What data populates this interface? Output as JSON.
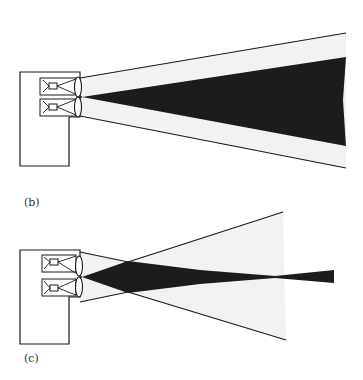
{
  "figure": {
    "panels": [
      {
        "id": "b",
        "label": "(b)",
        "description": "Two-lens projector with wide outer beam cone and dark diverging inner beam"
      },
      {
        "id": "c",
        "label": "(c)",
        "description": "Two-lens projector with crossing outer rays and dark beam converging to a waist then re-expanding"
      }
    ]
  },
  "colors": {
    "line": "#1a1a1a",
    "beam_dark": "#1c1c1c",
    "beam_light": "#f2f2f2",
    "background": "#ffffff"
  }
}
